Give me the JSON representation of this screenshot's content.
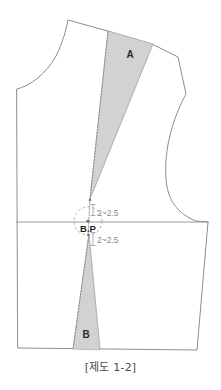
{
  "figure": {
    "caption": "[제도 1-2]",
    "title_text": "[제도 1-2]",
    "background_color": "#ffffff"
  },
  "colors": {
    "outline": "#8d8d8d",
    "wedge_fill": "#d2d2d2",
    "wedge_stroke": "#a8a8a8",
    "dash_line": "#9a9a9a",
    "dim_text": "#8a8a8a",
    "label_text": "#2b2b2b",
    "caption_text": "#4a4a4a"
  },
  "labels": {
    "wedge_a": "A",
    "wedge_b": "B",
    "bust_point": "B.P",
    "dim_upper": "2~2.5",
    "dim_lower": "2~2.5"
  },
  "geometry": {
    "bust_line_y": 222,
    "bust_point_x": 88,
    "bust_point_y": 222,
    "pivot_circle_radius": 14
  }
}
